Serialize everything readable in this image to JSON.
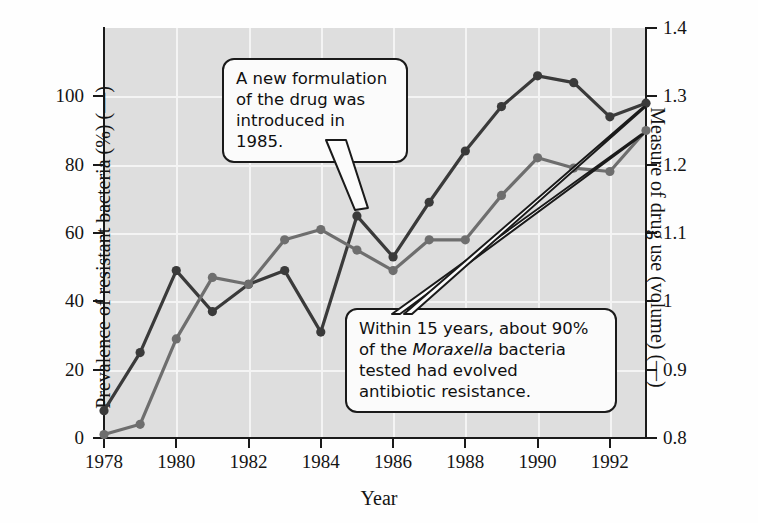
{
  "chart_data": {
    "type": "line",
    "title": "",
    "xlabel": "Year",
    "ylabel_left": "Prevalence of resistant bacteria (%) (—)",
    "ylabel_right": "Measure of drug use (volume) (—)",
    "x": [
      1978,
      1979,
      1980,
      1981,
      1982,
      1983,
      1984,
      1985,
      1986,
      1987,
      1988,
      1989,
      1990,
      1991,
      1992,
      1993
    ],
    "xlim": [
      1978,
      1993
    ],
    "xticks": [
      "1978",
      "1980",
      "1982",
      "1984",
      "1986",
      "1988",
      "1990",
      "1992"
    ],
    "xtick_values": [
      1978,
      1980,
      1982,
      1984,
      1986,
      1988,
      1990,
      1992
    ],
    "ylim_left": [
      0,
      120
    ],
    "yticks_left": [
      "0",
      "20",
      "40",
      "60",
      "80",
      "100"
    ],
    "ytick_values_left": [
      0,
      20,
      40,
      60,
      80,
      100
    ],
    "ylim_right": [
      0.8,
      1.4
    ],
    "yticks_right": [
      "0.8",
      "0.9",
      "1",
      "1.1",
      "1.2",
      "1.3",
      "1.4"
    ],
    "ytick_values_right": [
      0.8,
      0.9,
      1.0,
      1.1,
      1.2,
      1.3,
      1.4
    ],
    "grid": true,
    "legend_position": "none",
    "series": [
      {
        "name": "Prevalence of resistant bacteria (%)",
        "axis": "left",
        "color": "#3a3a3a",
        "values": [
          8,
          25,
          49,
          37,
          45,
          49,
          31,
          65,
          53,
          69,
          84,
          97,
          106,
          104,
          94,
          98
        ]
      },
      {
        "name": "Measure of drug use (volume)",
        "axis": "right",
        "color": "#6e6e6e",
        "values": [
          0.805,
          0.82,
          0.945,
          1.035,
          1.025,
          1.09,
          1.105,
          1.075,
          1.045,
          1.09,
          1.09,
          1.155,
          1.21,
          1.195,
          1.19,
          1.25
        ]
      }
    ],
    "annotations": [
      {
        "name": "callout-formulation",
        "text": "A new formulation of the drug was introduced in 1985.",
        "lines": [
          "A new formulation",
          "of the drug was",
          "introduced in 1985."
        ],
        "points_to_year": 1985
      },
      {
        "name": "callout-resistance",
        "text": "Within 15 years, about 90% of the Moraxella bacteria tested had evolved antibiotic resistance.",
        "lines": [
          "Within 15 years, about 90%",
          "of the $Moraxella$ bacteria",
          "tested had evolved",
          "antibiotic resistance."
        ],
        "line2_pre": "of the ",
        "line2_italic": "Moraxella",
        "line2_post": " bacteria",
        "points_to_year": 1993
      }
    ]
  },
  "colors": {
    "plot_background": "#dedede",
    "gridline": "#f4f4f4",
    "axis": "#1a1a1a",
    "series_dark": "#3a3a3a",
    "series_gray": "#6e6e6e",
    "callout_background": "#fbfbfb",
    "page_background": "#fefefe"
  },
  "callouts": {
    "formulation": {
      "line1": "A new formulation",
      "line2": "of the drug was",
      "line3": "introduced in 1985."
    },
    "resistance": {
      "line1": "Within 15 years, about 90%",
      "line2_pre": "of the ",
      "line2_italic": "Moraxella",
      "line2_post": " bacteria",
      "line3": "tested had evolved",
      "line4": "antibiotic resistance."
    }
  }
}
